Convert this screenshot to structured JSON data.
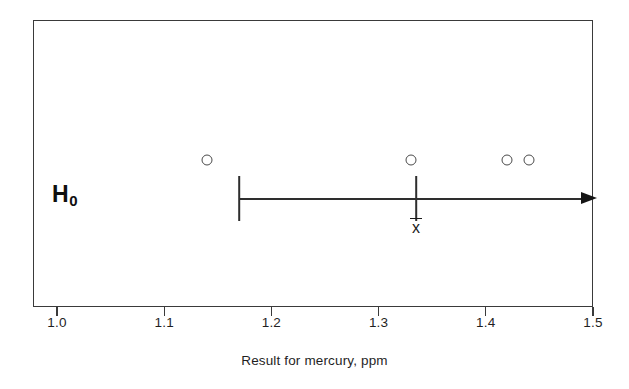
{
  "chart_data": {
    "type": "scatter",
    "title": "",
    "xlabel": "Result for mercury, ppm",
    "ylabel": "",
    "xlim": [
      1.0,
      1.5
    ],
    "xticks": [
      "1.0",
      "1.1",
      "1.2",
      "1.3",
      "1.4",
      "1.5"
    ],
    "xtick_values": [
      1.0,
      1.1,
      1.2,
      1.3,
      1.4,
      1.5
    ],
    "grid": false,
    "legend": null,
    "series": [
      {
        "name": "Result for mercury",
        "marker": "open-circle",
        "x": [
          1.14,
          1.33,
          1.42,
          1.44
        ],
        "y": [
          1,
          1,
          1,
          1
        ]
      }
    ],
    "annotations": [
      {
        "name": "null-hypothesis-label",
        "text": "H",
        "subscript": "0",
        "x": 1.017,
        "note": "H-zero label at left of plot"
      },
      {
        "name": "mean-marker-label",
        "text": "x̄",
        "x": 1.335,
        "note": "sample mean x-bar tick on the interval line"
      }
    ],
    "interval": {
      "name": "one-sided-confidence-interval",
      "start": 1.17,
      "end_arrow": 1.489,
      "arrow_direction": "right",
      "mean": 1.335,
      "open_ended": true
    },
    "colors": {
      "frame": "#3a3a3a",
      "line": "#2e2e2e",
      "marker": "#4a4a4a",
      "text": "#1f1f1f",
      "background": "#ffffff"
    }
  },
  "axis": {
    "title": "Result for mercury, ppm",
    "ticks": [
      {
        "label": "1.0",
        "value": 1.0
      },
      {
        "label": "1.1",
        "value": 1.1
      },
      {
        "label": "1.2",
        "value": 1.2
      },
      {
        "label": "1.3",
        "value": 1.3
      },
      {
        "label": "1.4",
        "value": 1.4
      },
      {
        "label": "1.5",
        "value": 1.5
      }
    ]
  },
  "labels": {
    "h0_main": "H",
    "h0_sub": "0",
    "xbar_glyph": "x"
  }
}
